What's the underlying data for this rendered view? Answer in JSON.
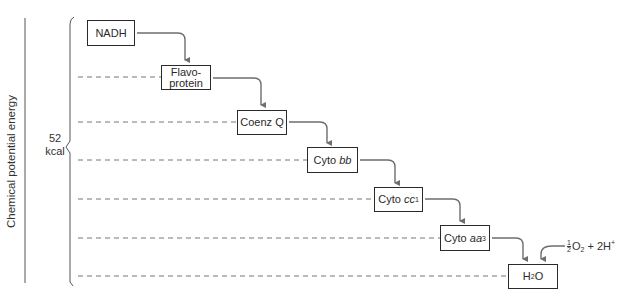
{
  "axis": {
    "label": "Chemical potential energy",
    "brace_value": "52",
    "brace_unit": "kcal"
  },
  "carriers": [
    {
      "id": "nadh",
      "label": "NADH"
    },
    {
      "id": "flavoprotein",
      "label_line1": "Flavo-",
      "label_line2": "protein"
    },
    {
      "id": "coenzq",
      "label": "Coenz Q"
    },
    {
      "id": "cytobb",
      "prefix": "Cyto ",
      "italic": "bb"
    },
    {
      "id": "cytocc1",
      "prefix": "Cyto ",
      "italic": "cc",
      "sub": "1"
    },
    {
      "id": "cytoaa3",
      "prefix": "Cyto ",
      "italic": "aa",
      "sub": "3"
    },
    {
      "id": "water",
      "main": "H",
      "sub": "2",
      "tail": "O"
    }
  ],
  "oxygen_input": {
    "frac_num": "1",
    "frac_den": "2",
    "o": "O",
    "o_sub": "2",
    "plus": " + 2H",
    "sup": "+"
  },
  "colors": {
    "arrow": "#6e6e6e",
    "dash": "#777777",
    "box_border": "#2a2a2a"
  }
}
